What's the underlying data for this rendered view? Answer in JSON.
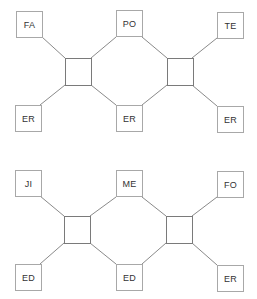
{
  "colors": {
    "background": "#ffffff",
    "node_border": "#a8a8a8",
    "hub_border": "#7a7a7a",
    "link": "#8a8a8a",
    "text": "#333333"
  },
  "diagrams": [
    {
      "name": "top",
      "nodes": {
        "top_left": "FA",
        "top_middle": "PO",
        "top_right": "TE",
        "bottom_left": "ER",
        "bottom_middle": "ER",
        "bottom_right": "ER"
      }
    },
    {
      "name": "bottom",
      "nodes": {
        "top_left": "JI",
        "top_middle": "ME",
        "top_right": "FO",
        "bottom_left": "ED",
        "bottom_middle": "ED",
        "bottom_right": "ER"
      }
    }
  ]
}
